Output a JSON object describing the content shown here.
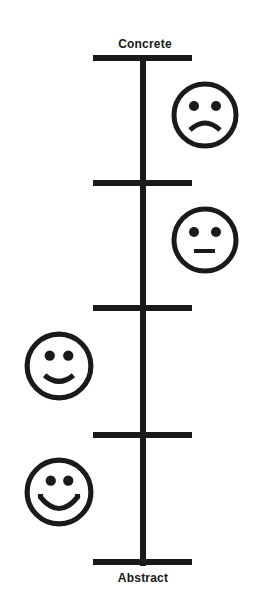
{
  "diagram": {
    "top_label": "Concrete",
    "bottom_label": "Abstract",
    "ink_color": "#1a1a1a",
    "background": "#ffffff",
    "faces": [
      {
        "expression": "sad",
        "side": "right"
      },
      {
        "expression": "neutral",
        "side": "right"
      },
      {
        "expression": "smile",
        "side": "left"
      },
      {
        "expression": "big-smile",
        "side": "left"
      }
    ],
    "tick_count": 5
  }
}
